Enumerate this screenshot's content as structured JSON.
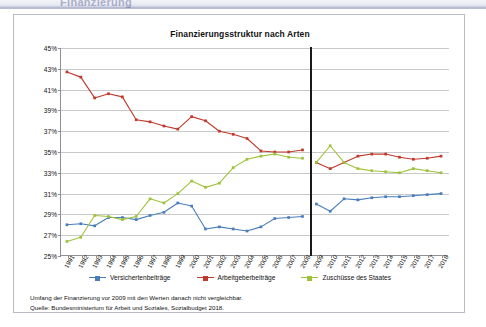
{
  "header": {
    "partial_text": "Finanzierung"
  },
  "card": {
    "title": "Finanzierungsstruktur nach Arten"
  },
  "footnote": {
    "line1": "Umfang der Finanzierung vor 2009 mit den Werten danach nicht vergleichbar.",
    "line2": "Quelle: Bundesministerium für Arbeit und Soziales, Sozialbudget 2018."
  },
  "colors": {
    "blue": "#4a7ebb",
    "red": "#c0392b",
    "green": "#9fc23c",
    "grid": "#c8c9cb",
    "axis": "#8d8f94",
    "break": "#1a1a1a"
  },
  "chart_data": {
    "type": "line",
    "title": "Finanzierungsstruktur nach Arten",
    "xlabel": "",
    "ylabel": "",
    "ylim": [
      25,
      45
    ],
    "ytick_labels": [
      "25%",
      "27%",
      "29%",
      "31%",
      "33%",
      "35%",
      "37%",
      "39%",
      "41%",
      "43%",
      "45%"
    ],
    "ytick_values": [
      25,
      27,
      29,
      31,
      33,
      35,
      37,
      39,
      41,
      43,
      45
    ],
    "grid": true,
    "legend_position": "bottom",
    "break_after": 2008,
    "break_note": "Umfang der Finanzierung vor 2009 mit den Werten danach nicht vergleichbar.",
    "categories": [
      "1991",
      "1992",
      "1993",
      "1994",
      "1995",
      "1996",
      "1997",
      "1998",
      "1999",
      "2000",
      "2001",
      "2002",
      "2003",
      "2004",
      "2005",
      "2006",
      "2007",
      "2008",
      "2009",
      "2010",
      "2011",
      "2012",
      "2013",
      "2014",
      "2015",
      "2016",
      "2017",
      "2018"
    ],
    "series": [
      {
        "name": "Versichertenbeiträge",
        "color": "#4a7ebb",
        "values": [
          28.0,
          28.1,
          27.9,
          28.7,
          28.7,
          28.5,
          28.9,
          29.2,
          30.1,
          29.8,
          27.6,
          27.8,
          27.6,
          27.4,
          27.8,
          28.6,
          28.7,
          28.8,
          30.0,
          29.3,
          30.5,
          30.4,
          30.6,
          30.7,
          30.7,
          30.8,
          30.9,
          31.0
        ]
      },
      {
        "name": "Arbeitgeberbeiträge",
        "color": "#c0392b",
        "values": [
          42.7,
          42.2,
          40.2,
          40.6,
          40.3,
          38.1,
          37.9,
          37.5,
          37.2,
          38.4,
          38.0,
          37.0,
          36.7,
          36.3,
          35.1,
          35.0,
          35.0,
          35.2,
          34.0,
          33.4,
          34.0,
          34.6,
          34.8,
          34.8,
          34.5,
          34.3,
          34.4,
          34.6
        ]
      },
      {
        "name": "Zuschüsse des Staates",
        "color": "#9fc23c",
        "values": [
          26.4,
          26.8,
          28.9,
          28.8,
          28.5,
          28.8,
          30.5,
          30.1,
          31.0,
          32.2,
          31.6,
          32.0,
          33.5,
          34.3,
          34.6,
          34.8,
          34.5,
          34.4,
          34.0,
          35.6,
          34.0,
          33.4,
          33.2,
          33.1,
          33.0,
          33.4,
          33.2,
          33.0
        ]
      }
    ]
  }
}
